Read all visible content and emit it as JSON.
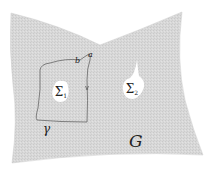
{
  "diagram": {
    "region_label": "G",
    "hole1_label": "Σ₁",
    "hole1_main": "Σ",
    "hole1_sub": "1",
    "hole2_label": "Σ₂",
    "hole2_main": "Σ",
    "hole2_sub": "2",
    "curve_label": "γ",
    "point_a_label": "a",
    "point_b_label": "b",
    "colors": {
      "region_fill": "#d6d6d6",
      "hole_fill": "#ffffff",
      "curve_stroke": "#555555",
      "text": "#222222"
    }
  }
}
